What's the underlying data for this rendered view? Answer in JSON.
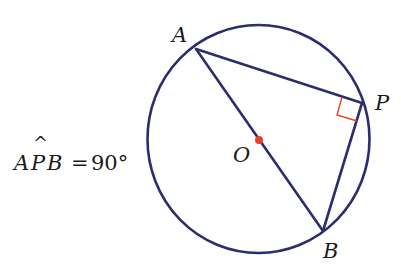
{
  "equation": {
    "point_a": "A",
    "point_p": "P",
    "point_b": "B",
    "hat": "^",
    "equals": "=",
    "value": "90°"
  },
  "points": {
    "A": {
      "label": "A",
      "x": 196,
      "y": 49
    },
    "P": {
      "label": "P",
      "x": 362,
      "y": 103
    },
    "B": {
      "label": "B",
      "x": 323,
      "y": 231
    },
    "O": {
      "label": "O",
      "x": 259,
      "y": 140
    }
  },
  "circle": {
    "cx": 258.5,
    "cy": 139,
    "rx": 111,
    "ry": 114
  },
  "colors": {
    "line": "#2b2d6e",
    "center_dot": "#e8402a",
    "right_angle_marker": "#e8402a",
    "text": "#1a1a1a"
  }
}
